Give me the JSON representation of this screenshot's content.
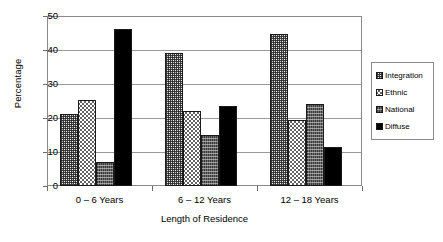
{
  "chart_data": {
    "type": "bar",
    "title": "",
    "xlabel": "Length of Residence",
    "ylabel": "Percentage",
    "categories": [
      "0 – 6 Years",
      "6 – 12 Years",
      "12 – 18 Years"
    ],
    "series": [
      {
        "name": "Integration",
        "values": [
          21.3,
          39.2,
          44.8
        ],
        "pattern": "grey-stipple",
        "color": "#b9b9b9"
      },
      {
        "name": "Ethnic",
        "values": [
          25.2,
          22.0,
          19.5
        ],
        "pattern": "light-crosshatch",
        "color": "#ffffff"
      },
      {
        "name": "National",
        "values": [
          7.1,
          14.9,
          24.0
        ],
        "pattern": "dark-grey-texture",
        "color": "#6d6d6d"
      },
      {
        "name": "Diffuse",
        "values": [
          46.1,
          23.6,
          11.5
        ],
        "pattern": "solid-black",
        "color": "#000000"
      }
    ],
    "ylim": [
      0,
      50
    ],
    "yticks": [
      0,
      10,
      20,
      30,
      40,
      50
    ],
    "ytick_labels": [
      "0",
      "10",
      "20",
      "30",
      "40",
      "50"
    ],
    "grid": true,
    "grid_axis": "y",
    "legend_position": "right",
    "legend_entries": [
      "Integration",
      "Ethnic",
      "National",
      "Diffuse"
    ],
    "bar_outline_color": "#1a1a1a",
    "frame_color": "#8a8a8a",
    "gridline_color": "#9a9a9a"
  }
}
